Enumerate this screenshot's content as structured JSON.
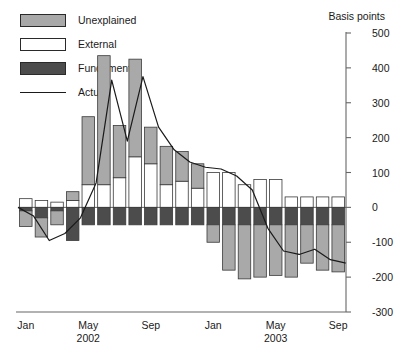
{
  "legend": {
    "items": [
      {
        "key": "unexplained",
        "label": "Unexplained",
        "swatch": "filled-gray"
      },
      {
        "key": "external",
        "label": "External",
        "swatch": "filled-white"
      },
      {
        "key": "fundamental",
        "label": "Fundamental",
        "swatch": "filled-darkgray"
      },
      {
        "key": "actual",
        "label": "Actual",
        "swatch": "line"
      }
    ]
  },
  "axis_title": "Basis points",
  "colors": {
    "unexplained": "#a9a9a9",
    "external": "#ffffff",
    "fundamental": "#4c4c4c",
    "actual_line": "#1a1a1a",
    "axis": "#666666",
    "bar_outline": "#3a3a3a"
  },
  "chart_data": {
    "type": "bar",
    "title": "",
    "xlabel": "",
    "ylabel": "Basis points",
    "ylim": [
      -300,
      500
    ],
    "yticks": [
      500,
      400,
      300,
      200,
      100,
      0,
      -100,
      -200,
      -300
    ],
    "ytick_labels": [
      "500",
      "400",
      "300",
      "200",
      "100",
      "0",
      "-100",
      "-200",
      "-300"
    ],
    "grid": false,
    "legend_position": "top-left",
    "stacked": true,
    "x": [
      "Jan 2002",
      "Feb 2002",
      "Mar 2002",
      "Apr 2002",
      "May 2002",
      "Jun 2002",
      "Jul 2002",
      "Aug 2002",
      "Sep 2002",
      "Oct 2002",
      "Nov 2002",
      "Dec 2002",
      "Jan 2003",
      "Feb 2003",
      "Mar 2003",
      "Apr 2003",
      "May 2003",
      "Jun 2003",
      "Jul 2003",
      "Aug 2003",
      "Sep 2003"
    ],
    "xtick_labels": [
      "Jan",
      "May",
      "Sep",
      "Jan",
      "May",
      "Sep"
    ],
    "xtick_years": [
      "",
      "2002",
      "",
      "",
      "2003",
      ""
    ],
    "xtick_indices": [
      0,
      4,
      8,
      12,
      16,
      20
    ],
    "series": [
      {
        "name": "Unexplained",
        "color": "#a9a9a9",
        "values": [
          -45,
          -55,
          -40,
          25,
          195,
          370,
          150,
          280,
          105,
          110,
          85,
          70,
          -50,
          -130,
          -155,
          -150,
          -145,
          -150,
          -110,
          -130,
          -135
        ]
      },
      {
        "name": "External",
        "color": "#ffffff",
        "values": [
          25,
          20,
          15,
          20,
          65,
          65,
          85,
          145,
          125,
          65,
          75,
          55,
          100,
          100,
          65,
          80,
          80,
          30,
          30,
          30,
          30
        ]
      },
      {
        "name": "Fundamental",
        "color": "#4c4c4c",
        "values": [
          -10,
          -30,
          -10,
          -95,
          -50,
          -50,
          -50,
          -50,
          -50,
          -50,
          -50,
          -50,
          -50,
          -50,
          -50,
          -50,
          -50,
          -50,
          -50,
          -50,
          -50
        ]
      }
    ],
    "actual": {
      "name": "Actual",
      "color": "#1a1a1a",
      "values": [
        0,
        -25,
        -95,
        -75,
        -30,
        70,
        365,
        190,
        375,
        230,
        165,
        130,
        115,
        110,
        90,
        50,
        -60,
        -125,
        -135,
        -120,
        -150,
        -160
      ]
    }
  }
}
